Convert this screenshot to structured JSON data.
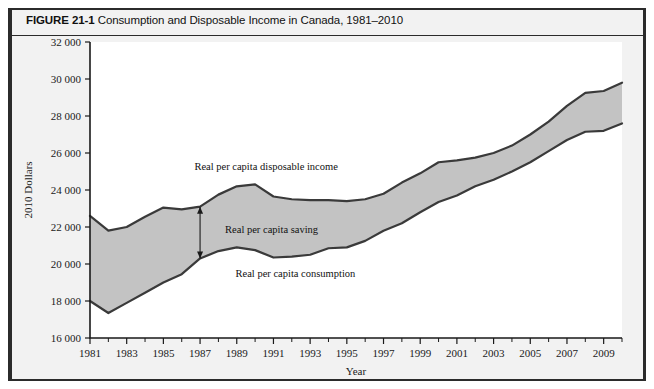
{
  "figure": {
    "number": "FIGURE 21-1",
    "title": "Consumption and Disposable Income in Canada, 1981–2010"
  },
  "annotations": {
    "income_label": "Real per capita disposable income",
    "saving_label": "Real per capita saving",
    "consumption_label": "Real per capita consumption"
  },
  "axes": {
    "ylabel": "2010 Dollars",
    "xlabel": "Year",
    "yticks": [
      "16 000",
      "18 000",
      "20 000",
      "22 000",
      "24 000",
      "26 000",
      "28 000",
      "30 000",
      "32 000"
    ],
    "xticks": [
      "1981",
      "1983",
      "1985",
      "1987",
      "1989",
      "1991",
      "1993",
      "1995",
      "1997",
      "1999",
      "2001",
      "2003",
      "2005",
      "2007",
      "2009"
    ]
  },
  "colors": {
    "band_fill": "#c3c3c3",
    "line": "#3a3a3a",
    "figure_bg": "#f2f2f2",
    "plot_bg": "#ffffff",
    "border": "#2b2b2b"
  },
  "chart_data": {
    "type": "area",
    "title": "Consumption and Disposable Income in Canada, 1981–2010",
    "xlabel": "Year",
    "ylabel": "2010 Dollars",
    "xlim": [
      1981,
      2010
    ],
    "ylim": [
      16000,
      32000
    ],
    "grid": false,
    "legend": "annotated-inline",
    "x": [
      1981,
      1982,
      1983,
      1984,
      1985,
      1986,
      1987,
      1988,
      1989,
      1990,
      1991,
      1992,
      1993,
      1994,
      1995,
      1996,
      1997,
      1998,
      1999,
      2000,
      2001,
      2002,
      2003,
      2004,
      2005,
      2006,
      2007,
      2008,
      2009,
      2010
    ],
    "series": [
      {
        "name": "Real per capita disposable income",
        "values": [
          22600,
          21800,
          22000,
          22550,
          23050,
          22950,
          23100,
          23750,
          24200,
          24300,
          23650,
          23500,
          23450,
          23450,
          23400,
          23500,
          23800,
          24400,
          24900,
          25500,
          25600,
          25750,
          26000,
          26400,
          27000,
          27700,
          28550,
          29250,
          29350,
          29800
        ]
      },
      {
        "name": "Real per capita consumption",
        "values": [
          18000,
          17350,
          17900,
          18450,
          19000,
          19450,
          20300,
          20700,
          20900,
          20750,
          20350,
          20400,
          20500,
          20850,
          20900,
          21250,
          21800,
          22200,
          22800,
          23350,
          23700,
          24200,
          24550,
          25000,
          25500,
          26100,
          26700,
          27150,
          27200,
          27600
        ]
      }
    ],
    "saving_arrow": {
      "year": 1987,
      "from": 20300,
      "to": 23100
    }
  }
}
